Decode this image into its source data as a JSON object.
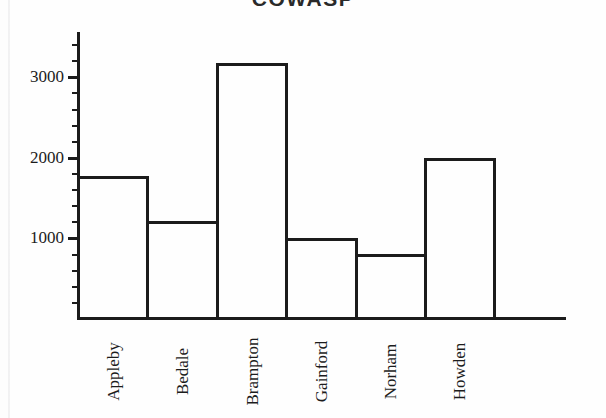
{
  "chart_data": {
    "type": "bar",
    "title": "COWASP",
    "title_note": "title is cropped at the top edge of the image",
    "xlabel": "",
    "ylabel": "",
    "categories": [
      "Appleby",
      "Bedale",
      "Brampton",
      "Gainford",
      "Norham",
      "Howden"
    ],
    "values": [
      1760,
      1200,
      3170,
      990,
      800,
      1980
    ],
    "ylim": [
      0,
      3550
    ],
    "ytick_labels": [
      "1000",
      "2000",
      "3000"
    ],
    "ytick_values": [
      1000,
      2000,
      3000
    ],
    "minor_tick_interval": 200,
    "grid": false,
    "legend": false,
    "bar_style": {
      "fill": "none",
      "outline_color": "#1c1c1c",
      "outline_width": 3,
      "adjacent": true
    },
    "axis_color": "#1c1c1c",
    "background": "#fefefe"
  },
  "figure": {
    "title": "COWASP",
    "y_ticks": [
      {
        "label": "1000",
        "value": 1000
      },
      {
        "label": "2000",
        "value": 2000
      },
      {
        "label": "3000",
        "value": 3000
      }
    ],
    "bars": [
      {
        "label": "Appleby",
        "value": 1760
      },
      {
        "label": "Bedale",
        "value": 1200
      },
      {
        "label": "Brampton",
        "value": 3170
      },
      {
        "label": "Gainford",
        "value": 990
      },
      {
        "label": "Norham",
        "value": 800
      },
      {
        "label": "Howden",
        "value": 1980
      }
    ]
  }
}
